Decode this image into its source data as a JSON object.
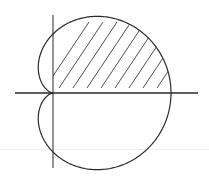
{
  "diagram": {
    "type": "polar-curve",
    "curve": "cardioid",
    "equation_form": "r = a(1 + cos θ)",
    "shaded_region": "upper half of cardioid (θ from 0 to π)",
    "shading": "diagonal hatch lines",
    "hatch_line_count": 8,
    "axes": [
      "horizontal axis",
      "vertical axis"
    ],
    "colors": {
      "stroke": "#2a2a2a",
      "hatch": "#3a3a3a",
      "background": "#ffffff"
    }
  }
}
